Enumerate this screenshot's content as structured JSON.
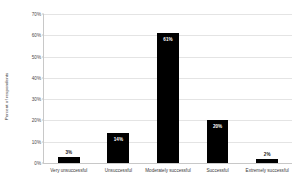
{
  "chart_data": {
    "type": "bar",
    "title": "",
    "xlabel": "",
    "ylabel": "Percent of respondents",
    "categories": [
      "Very unsuccessful",
      "Unsuccessful",
      "Moderately successful",
      "Successful",
      "Extremely successful"
    ],
    "values": [
      3,
      14,
      61,
      20,
      2
    ],
    "value_labels": [
      "3%",
      "14%",
      "61%",
      "20%",
      "2%"
    ],
    "ylim": [
      0,
      70
    ],
    "yticks": [
      0,
      10,
      20,
      30,
      40,
      50,
      60,
      70
    ],
    "ytick_labels": [
      "0%",
      "10%",
      "20%",
      "30%",
      "40%",
      "50%",
      "60%",
      "70%"
    ],
    "grid": true,
    "legend": "none",
    "bar_color": "#000000",
    "grid_color": "#e4e4e4",
    "axis_color": "#c8c8c8"
  }
}
